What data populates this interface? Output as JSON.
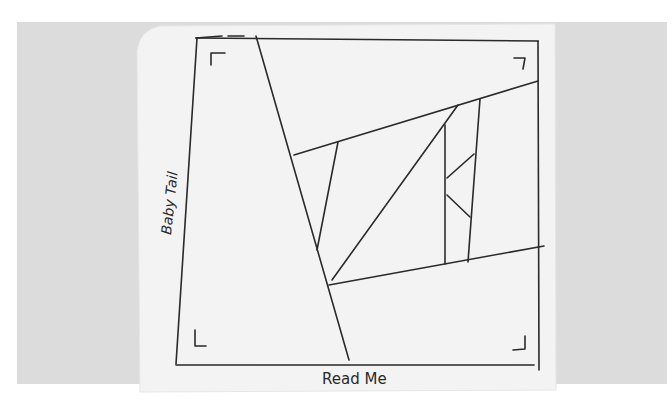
{
  "scene": {
    "description": "Photo of a paper napkin with a hand-drawn wireframe sketch",
    "background_color": "#dcdcdc",
    "napkin_color": "#f2f2f2",
    "ink_color": "#2a2a2a"
  },
  "sketch": {
    "left_label": "Baby Tail",
    "bottom_label": "Read Me",
    "corner_marks": [
      "top-left",
      "top-right",
      "bottom-left",
      "bottom-right"
    ]
  }
}
